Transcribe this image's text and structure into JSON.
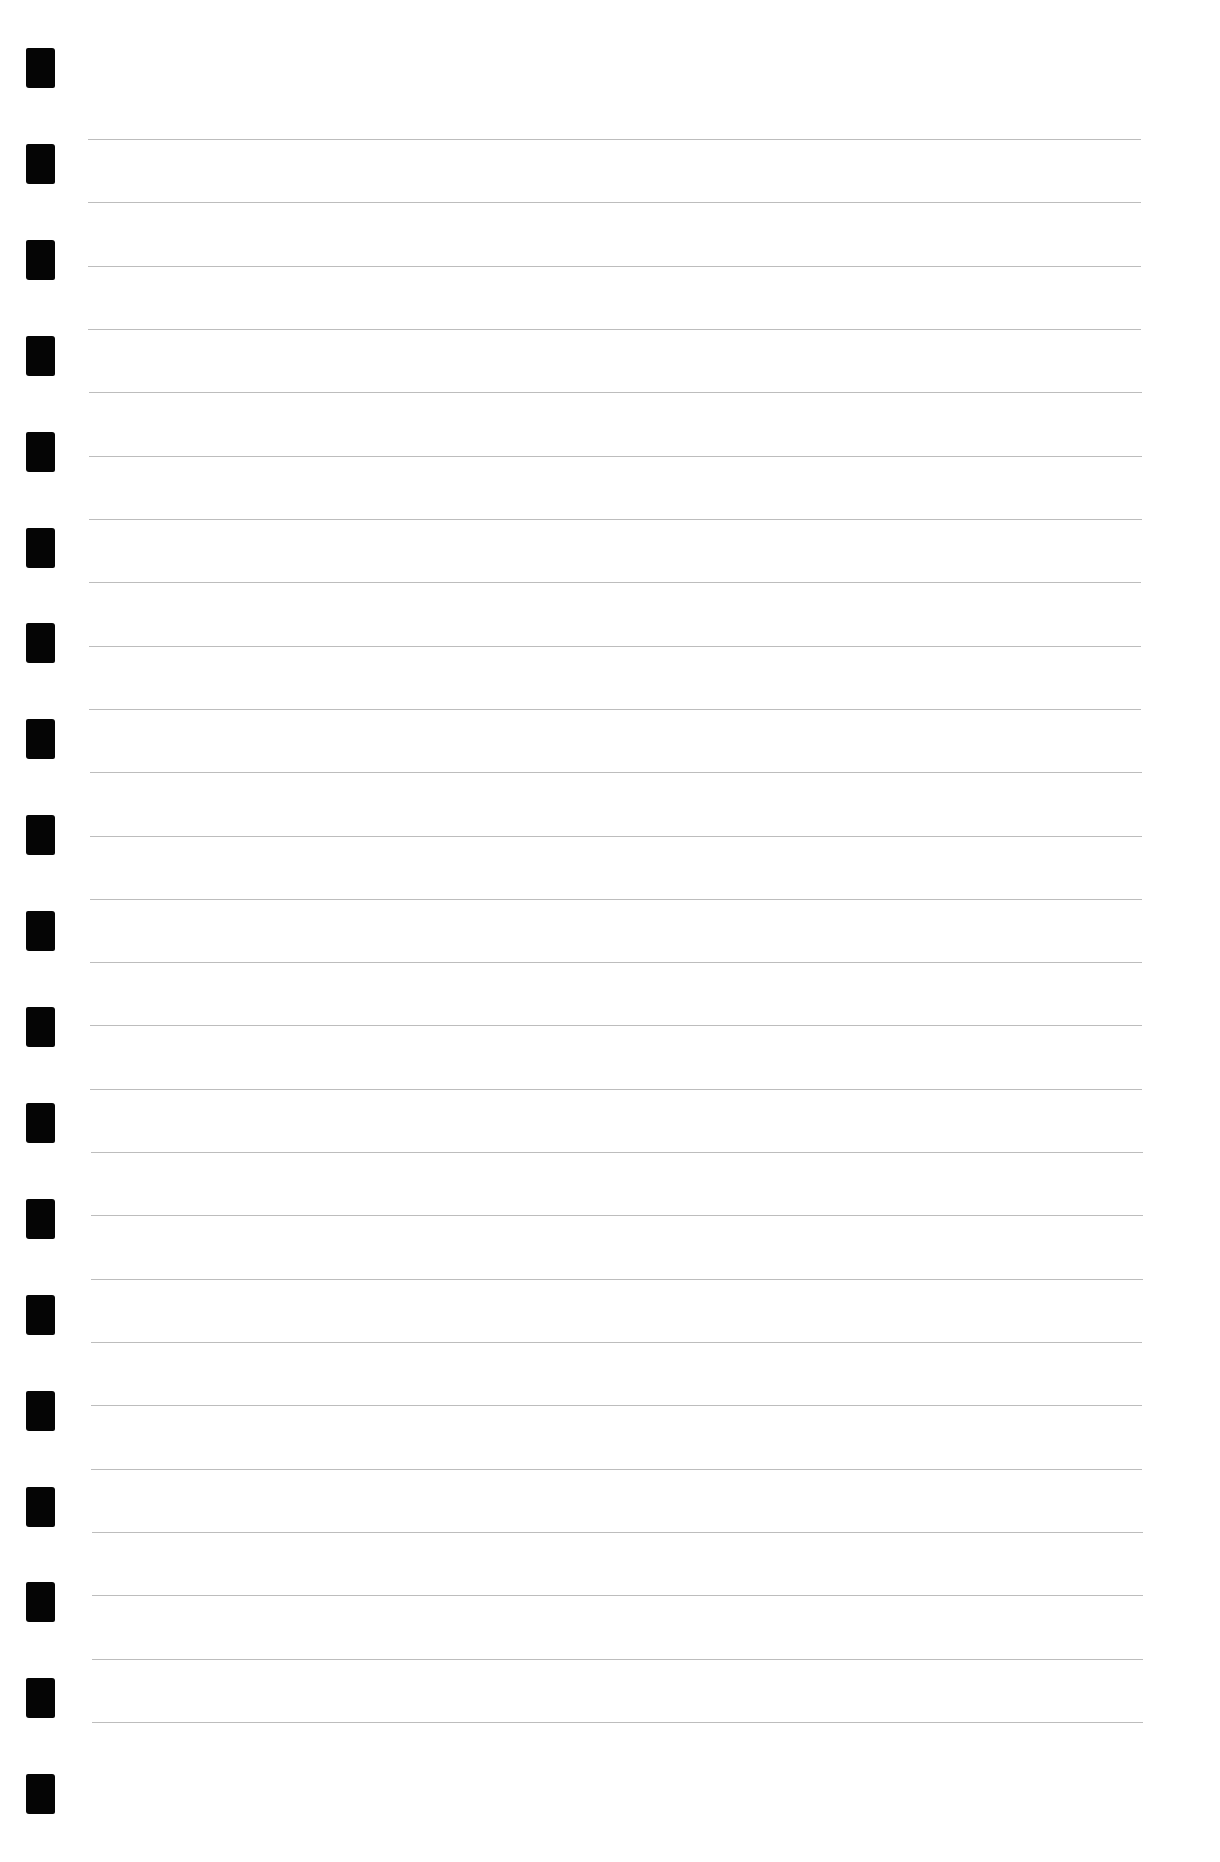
{
  "page": {
    "type": "lined-notebook-paper",
    "background_color": "#ffffff",
    "rule_color": "#bdbdbd",
    "punch_color": "#050505"
  },
  "punch_holes": {
    "count": 19,
    "left": 26,
    "first_top": 48,
    "spacing": 95.9,
    "width": 29,
    "height": 40
  },
  "rules": {
    "count": 26,
    "first_y": 139,
    "spacing": 63.32,
    "x_start_top": 88,
    "x_start_bottom": 92,
    "x_end_top": 1141,
    "x_end_bottom": 1143
  },
  "text_content": []
}
